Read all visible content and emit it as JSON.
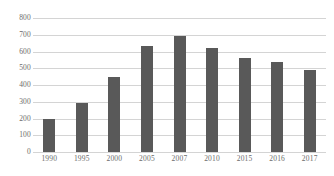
{
  "chart_data": {
    "type": "bar",
    "title": "",
    "subtitle": "",
    "xlabel": "",
    "ylabel": "",
    "categories": [
      "1990",
      "1995",
      "2000",
      "2005",
      "2007",
      "2010",
      "2015",
      "2016",
      "2017"
    ],
    "values": [
      200,
      290,
      450,
      630,
      690,
      620,
      560,
      540,
      490
    ],
    "series": [
      {
        "name": "",
        "values": [
          200,
          290,
          450,
          630,
          690,
          620,
          560,
          540,
          490
        ],
        "color": "#595959"
      }
    ],
    "ylim": [
      0,
      800
    ],
    "ytick_labels": [
      "0",
      "100",
      "200",
      "300",
      "400",
      "500",
      "600",
      "700",
      "800"
    ],
    "ytick_values": [
      0,
      100,
      200,
      300,
      400,
      500,
      600,
      700,
      800
    ],
    "grid": true,
    "grid_color": "#d4d4d4",
    "legend": false,
    "legend_position": "none",
    "background_color": "#ffffff",
    "tick_label_color": "#6b6b6b"
  }
}
